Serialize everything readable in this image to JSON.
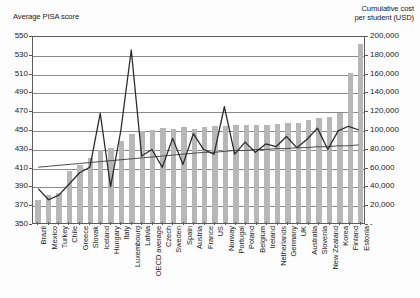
{
  "left_axis": {
    "title": "Average PISA score",
    "ticks": [
      550,
      530,
      510,
      490,
      470,
      450,
      430,
      410,
      390,
      370,
      350
    ],
    "min": 350,
    "max": 550
  },
  "right_axis": {
    "title_line1": "Cumulative cost",
    "title_line2": "per student (USD)",
    "ticks": [
      "200,000",
      "180,000",
      "160,000",
      "140,000",
      "120,000",
      "100,000",
      "80,000",
      "60,000",
      "40,000",
      "20,000",
      "-"
    ],
    "min": 0,
    "max": 200000
  },
  "colors": {
    "bar": "#b7b7b7",
    "line": "#2b2b2b",
    "trend": "#4a4a4a",
    "grid": "#8a8a8a",
    "frame": "#5b5b5b",
    "background": "#ffffff"
  },
  "chart_data": {
    "type": "bar",
    "title": "",
    "xlabel": "",
    "ylabel": "Average PISA score",
    "ylim": [
      350,
      550
    ],
    "y2label": "Cumulative cost per student (USD)",
    "y2lim": [
      0,
      200000
    ],
    "grid": true,
    "legend": "none",
    "categories": [
      "Brazil",
      "Mexico",
      "Turkey",
      "Chile",
      "Greece",
      "Slovak",
      "Iceland",
      "Hungary",
      "Italy",
      "Luxembourg",
      "Latvia",
      "OECD average",
      "Czech",
      "Sweden",
      "Spain",
      "Austria",
      "France",
      "US",
      "Norway",
      "Portugal",
      "Poland",
      "Belgium",
      "Ireland",
      "Netherlands",
      "Germany",
      "UK",
      "Australia",
      "Slovenia",
      "New Zealand",
      "Korea",
      "Finland",
      "Estonia"
    ],
    "series": [
      {
        "name": "Cumulative cost per student (USD)",
        "type": "bar",
        "axis": "right",
        "values": [
          24000,
          30000,
          32000,
          55000,
          62000,
          69000,
          78000,
          80000,
          87000,
          95000,
          98000,
          99000,
          101000,
          100000,
          102000,
          100000,
          102000,
          103000,
          103000,
          104000,
          104000,
          104000,
          104000,
          105000,
          106000,
          106000,
          110000,
          112000,
          113000,
          117000,
          160000,
          190000
        ]
      },
      {
        "name": "Average PISA score",
        "type": "line",
        "axis": "left",
        "values": [
          387,
          375,
          380,
          392,
          404,
          410,
          468,
          389,
          450,
          536,
          422,
          429,
          410,
          441,
          413,
          446,
          429,
          424,
          475,
          424,
          437,
          426,
          435,
          432,
          443,
          431,
          440,
          452,
          429,
          449,
          454,
          450
        ]
      },
      {
        "name": "Trend",
        "type": "line",
        "axis": "left",
        "values": [
          410,
          411,
          412,
          413,
          414,
          415,
          416,
          417,
          418,
          419,
          420,
          421,
          422,
          423,
          424,
          425,
          426,
          426,
          427,
          428,
          428,
          429,
          429,
          430,
          430,
          431,
          431,
          432,
          432,
          433,
          433,
          434
        ]
      }
    ]
  }
}
